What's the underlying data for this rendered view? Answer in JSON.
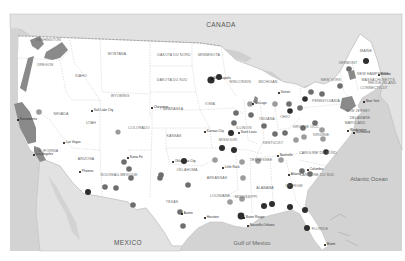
{
  "map": {
    "background_color": "#d6d6d6",
    "land_color": "#ffffff",
    "neighbor_land_color": "#e4e4e4",
    "water_color": "#cfcfcf",
    "highlight_region_color": "#8a8a8a",
    "region_labels": {
      "canada": "CANADA",
      "mexico": "MEXICO",
      "atlantic": "Atlantic Ocean",
      "gulf": "Gulf of Mexico"
    },
    "states": [
      {
        "id": "washington",
        "label": "WASHINGTON",
        "x": 48,
        "y": 41
      },
      {
        "id": "oregon",
        "label": "OREGON",
        "x": 45,
        "y": 66
      },
      {
        "id": "idaho",
        "label": "IDAHO",
        "x": 81,
        "y": 77
      },
      {
        "id": "montana",
        "label": "MONTANA",
        "x": 117,
        "y": 55
      },
      {
        "id": "dakota-nord",
        "label": "DAKOTA DU NORD",
        "x": 174,
        "y": 56
      },
      {
        "id": "minnesota",
        "label": "MINNESOTA",
        "x": 209,
        "y": 56
      },
      {
        "id": "dakota-sud",
        "label": "DAKOTA DU SUD",
        "x": 172,
        "y": 81
      },
      {
        "id": "wisconsin",
        "label": "WISCONSIN",
        "x": 240,
        "y": 83
      },
      {
        "id": "michigan",
        "label": "MICHIGAN",
        "x": 268,
        "y": 83
      },
      {
        "id": "wyoming",
        "label": "WYOMING",
        "x": 120,
        "y": 97
      },
      {
        "id": "nevada",
        "label": "NEVADA",
        "x": 61,
        "y": 115
      },
      {
        "id": "utah",
        "label": "UTAH",
        "x": 91,
        "y": 124
      },
      {
        "id": "colorado",
        "label": "COLORADO",
        "x": 139,
        "y": 129
      },
      {
        "id": "nebraska",
        "label": "NEBRASKA",
        "x": 173,
        "y": 110
      },
      {
        "id": "iowa",
        "label": "IOWA",
        "x": 210,
        "y": 105
      },
      {
        "id": "illinois",
        "label": "ILLINOIS",
        "x": 244,
        "y": 129
      },
      {
        "id": "indiana",
        "label": "INDIANA",
        "x": 267,
        "y": 120
      },
      {
        "id": "ohio",
        "label": "OHIO",
        "x": 285,
        "y": 118
      },
      {
        "id": "pennsylvania",
        "label": "PENNSYLVANIA",
        "x": 326,
        "y": 102
      },
      {
        "id": "new-york",
        "label": "NEW YORK",
        "x": 331,
        "y": 81
      },
      {
        "id": "vermont",
        "label": "VERMONT",
        "x": 348,
        "y": 64
      },
      {
        "id": "maine",
        "label": "MAINE",
        "x": 366,
        "y": 52
      },
      {
        "id": "new-hampshire",
        "label": "NEW HAMPSHIRE",
        "x": 373,
        "y": 75
      },
      {
        "id": "massachusetts",
        "label": "MASSACHUSETTS",
        "x": 378,
        "y": 81
      },
      {
        "id": "rhode-island",
        "label": "RHODE ISLAND",
        "x": 382,
        "y": 84
      },
      {
        "id": "connecticut",
        "label": "CONNECTICUT",
        "x": 374,
        "y": 89
      },
      {
        "id": "new-jersey",
        "label": "NEW JERSEY",
        "x": 358,
        "y": 112
      },
      {
        "id": "delaware",
        "label": "DELAWARE",
        "x": 360,
        "y": 119
      },
      {
        "id": "maryland",
        "label": "MARYLAND",
        "x": 355,
        "y": 124
      },
      {
        "id": "virginie-occ",
        "label": "VIRGINIE OCC.",
        "x": 306,
        "y": 128
      },
      {
        "id": "virginie",
        "label": "VIRGINIE",
        "x": 321,
        "y": 136
      },
      {
        "id": "kentucky",
        "label": "KENTUCKY",
        "x": 273,
        "y": 144
      },
      {
        "id": "kansas",
        "label": "KANSAS",
        "x": 174,
        "y": 137
      },
      {
        "id": "missouri",
        "label": "MISSOURI",
        "x": 228,
        "y": 141
      },
      {
        "id": "tennessee",
        "label": "TENNESSEE",
        "x": 261,
        "y": 161
      },
      {
        "id": "caroline-nord",
        "label": "CAROLINE DU NORD",
        "x": 318,
        "y": 154
      },
      {
        "id": "caroline-sud",
        "label": "CAROLINE DU SUD",
        "x": 317,
        "y": 176
      },
      {
        "id": "oklahoma",
        "label": "OKLAHOMA",
        "x": 187,
        "y": 171
      },
      {
        "id": "arkansas",
        "label": "ARKANSAS",
        "x": 217,
        "y": 179
      },
      {
        "id": "arizona",
        "label": "ARIZONA",
        "x": 86,
        "y": 160
      },
      {
        "id": "nouveau-mexique",
        "label": "NOUVEAU-MEXIQUE",
        "x": 119,
        "y": 176
      },
      {
        "id": "california",
        "label": "CALIFORNIA",
        "x": 47,
        "y": 152
      },
      {
        "id": "texas",
        "label": "TEXAS",
        "x": 172,
        "y": 203
      },
      {
        "id": "louisiane",
        "label": "LOUISIANE",
        "x": 220,
        "y": 197
      },
      {
        "id": "mississippi",
        "label": "MISSISSIPPI",
        "x": 246,
        "y": 198
      },
      {
        "id": "alabama",
        "label": "ALABAMA",
        "x": 265,
        "y": 189
      },
      {
        "id": "georgie",
        "label": "GEORGIE",
        "x": 294,
        "y": 187
      },
      {
        "id": "floride",
        "label": "FLORIDE",
        "x": 320,
        "y": 230
      }
    ],
    "cities": [
      {
        "id": "sacramento",
        "label": "Sacramento",
        "x": 18,
        "y": 120
      },
      {
        "id": "salt-lake-city",
        "label": "Salt Lake City",
        "x": 92,
        "y": 111
      },
      {
        "id": "cheyenne",
        "label": "Cheyenne",
        "x": 152,
        "y": 108
      },
      {
        "id": "las-vegas",
        "label": "Las Vegas",
        "x": 64,
        "y": 143
      },
      {
        "id": "los-angeles",
        "label": "Los Angeles",
        "x": 34,
        "y": 155
      },
      {
        "id": "phoenix",
        "label": "Phoenix",
        "x": 80,
        "y": 172
      },
      {
        "id": "santa-fe",
        "label": "Santa Fe",
        "x": 128,
        "y": 158
      },
      {
        "id": "minneapolis",
        "label": "Minneapolis",
        "x": 212,
        "y": 79
      },
      {
        "id": "kansas-city",
        "label": "Kansas City",
        "x": 205,
        "y": 132
      },
      {
        "id": "chicago",
        "label": "Chicago",
        "x": 253,
        "y": 104
      },
      {
        "id": "saint-louis",
        "label": "Saint Louis",
        "x": 239,
        "y": 133
      },
      {
        "id": "oklahoma-city",
        "label": "Oklahoma City",
        "x": 173,
        "y": 162
      },
      {
        "id": "little-rock",
        "label": "Little Rock",
        "x": 223,
        "y": 168
      },
      {
        "id": "nashville",
        "label": "Nashville",
        "x": 278,
        "y": 156
      },
      {
        "id": "detroit",
        "label": "Detroit",
        "x": 279,
        "y": 93
      },
      {
        "id": "austin",
        "label": "Austin",
        "x": 182,
        "y": 214
      },
      {
        "id": "houston",
        "label": "Houston",
        "x": 205,
        "y": 218
      },
      {
        "id": "baton-rouge",
        "label": "Baton Rouge",
        "x": 244,
        "y": 218
      },
      {
        "id": "nouvelle-orleans",
        "label": "Nouvelle-Orléans",
        "x": 248,
        "y": 226
      },
      {
        "id": "atlanta",
        "label": "Atlanta",
        "x": 289,
        "y": 175
      },
      {
        "id": "columbia",
        "label": "Columbia",
        "x": 308,
        "y": 170
      },
      {
        "id": "washington-dc",
        "label": "Washington",
        "x": 348,
        "y": 131
      },
      {
        "id": "richmond",
        "label": "Richmond",
        "x": 354,
        "y": 133
      },
      {
        "id": "new-york-city",
        "label": "New York",
        "x": 364,
        "y": 102
      },
      {
        "id": "boston",
        "label": "Boston",
        "x": 379,
        "y": 75
      },
      {
        "id": "miami",
        "label": "Miami",
        "x": 325,
        "y": 245
      }
    ],
    "markers": [
      {
        "x": 211,
        "y": 80,
        "r": 3.6,
        "shade": "dark"
      },
      {
        "x": 219,
        "y": 77,
        "r": 3.0,
        "shade": "dark"
      },
      {
        "x": 250,
        "y": 104,
        "r": 2.8,
        "shade": "light"
      },
      {
        "x": 236,
        "y": 113,
        "r": 2.8,
        "shade": "mid"
      },
      {
        "x": 251,
        "y": 115,
        "r": 2.8,
        "shade": "mid"
      },
      {
        "x": 234,
        "y": 123,
        "r": 2.8,
        "shade": "mid"
      },
      {
        "x": 231,
        "y": 133,
        "r": 3.0,
        "shade": "dark"
      },
      {
        "x": 222,
        "y": 148,
        "r": 3.0,
        "shade": "dark"
      },
      {
        "x": 234,
        "y": 150,
        "r": 3.0,
        "shade": "dark"
      },
      {
        "x": 215,
        "y": 160,
        "r": 2.8,
        "shade": "light"
      },
      {
        "x": 242,
        "y": 162,
        "r": 2.8,
        "shade": "light"
      },
      {
        "x": 258,
        "y": 161,
        "r": 2.8,
        "shade": "light"
      },
      {
        "x": 184,
        "y": 161,
        "r": 3.0,
        "shade": "dark"
      },
      {
        "x": 243,
        "y": 178,
        "r": 2.8,
        "shade": "light"
      },
      {
        "x": 242,
        "y": 199,
        "r": 2.8,
        "shade": "light"
      },
      {
        "x": 230,
        "y": 202,
        "r": 2.8,
        "shade": "light"
      },
      {
        "x": 275,
        "y": 104,
        "r": 2.8,
        "shade": "light"
      },
      {
        "x": 289,
        "y": 104,
        "r": 2.8,
        "shade": "mid"
      },
      {
        "x": 300,
        "y": 108,
        "r": 2.8,
        "shade": "mid"
      },
      {
        "x": 305,
        "y": 99,
        "r": 2.8,
        "shade": "dark"
      },
      {
        "x": 311,
        "y": 92,
        "r": 2.8,
        "shade": "mid"
      },
      {
        "x": 322,
        "y": 94,
        "r": 2.8,
        "shade": "mid"
      },
      {
        "x": 340,
        "y": 86,
        "r": 2.8,
        "shade": "mid"
      },
      {
        "x": 349,
        "y": 69,
        "r": 2.8,
        "shade": "mid"
      },
      {
        "x": 366,
        "y": 61,
        "r": 3.0,
        "shade": "dark"
      },
      {
        "x": 290,
        "y": 111,
        "r": 2.8,
        "shade": "dark"
      },
      {
        "x": 264,
        "y": 126,
        "r": 2.8,
        "shade": "mid"
      },
      {
        "x": 275,
        "y": 134,
        "r": 2.8,
        "shade": "mid"
      },
      {
        "x": 285,
        "y": 133,
        "r": 2.8,
        "shade": "mid"
      },
      {
        "x": 303,
        "y": 128,
        "r": 2.8,
        "shade": "mid"
      },
      {
        "x": 315,
        "y": 123,
        "r": 2.8,
        "shade": "mid"
      },
      {
        "x": 322,
        "y": 130,
        "r": 2.8,
        "shade": "light"
      },
      {
        "x": 323,
        "y": 139,
        "r": 2.8,
        "shade": "light"
      },
      {
        "x": 304,
        "y": 137,
        "r": 2.8,
        "shade": "light"
      },
      {
        "x": 296,
        "y": 140,
        "r": 2.8,
        "shade": "light"
      },
      {
        "x": 326,
        "y": 152,
        "r": 2.8,
        "shade": "dark"
      },
      {
        "x": 281,
        "y": 160,
        "r": 2.8,
        "shade": "light"
      },
      {
        "x": 302,
        "y": 171,
        "r": 2.8,
        "shade": "mid"
      },
      {
        "x": 310,
        "y": 174,
        "r": 2.8,
        "shade": "mid"
      },
      {
        "x": 290,
        "y": 186,
        "r": 3.0,
        "shade": "dark"
      },
      {
        "x": 264,
        "y": 206,
        "r": 3.0,
        "shade": "dark"
      },
      {
        "x": 272,
        "y": 204,
        "r": 3.0,
        "shade": "dark"
      },
      {
        "x": 290,
        "y": 207,
        "r": 3.0,
        "shade": "dark"
      },
      {
        "x": 305,
        "y": 210,
        "r": 3.0,
        "shade": "dark"
      },
      {
        "x": 307,
        "y": 228,
        "r": 3.0,
        "shade": "dark"
      },
      {
        "x": 241,
        "y": 216,
        "r": 3.4,
        "shade": "dark"
      },
      {
        "x": 39,
        "y": 112,
        "r": 2.8,
        "shade": "light"
      },
      {
        "x": 118,
        "y": 132,
        "r": 2.6,
        "shade": "light"
      },
      {
        "x": 124,
        "y": 162,
        "r": 2.8,
        "shade": "mid"
      },
      {
        "x": 129,
        "y": 169,
        "r": 2.8,
        "shade": "mid"
      },
      {
        "x": 131,
        "y": 178,
        "r": 2.8,
        "shade": "mid"
      },
      {
        "x": 105,
        "y": 187,
        "r": 2.8,
        "shade": "mid"
      },
      {
        "x": 116,
        "y": 188,
        "r": 2.8,
        "shade": "mid"
      },
      {
        "x": 88,
        "y": 192,
        "r": 3.0,
        "shade": "dark"
      },
      {
        "x": 160,
        "y": 178,
        "r": 2.8,
        "shade": "mid"
      },
      {
        "x": 133,
        "y": 205,
        "r": 2.8,
        "shade": "mid"
      },
      {
        "x": 188,
        "y": 185,
        "r": 2.8,
        "shade": "mid"
      },
      {
        "x": 180,
        "y": 212,
        "r": 2.8,
        "shade": "mid"
      },
      {
        "x": 183,
        "y": 226,
        "r": 2.8,
        "shade": "mid"
      },
      {
        "x": 161,
        "y": 175,
        "r": 2.8,
        "shade": "mid"
      }
    ]
  }
}
